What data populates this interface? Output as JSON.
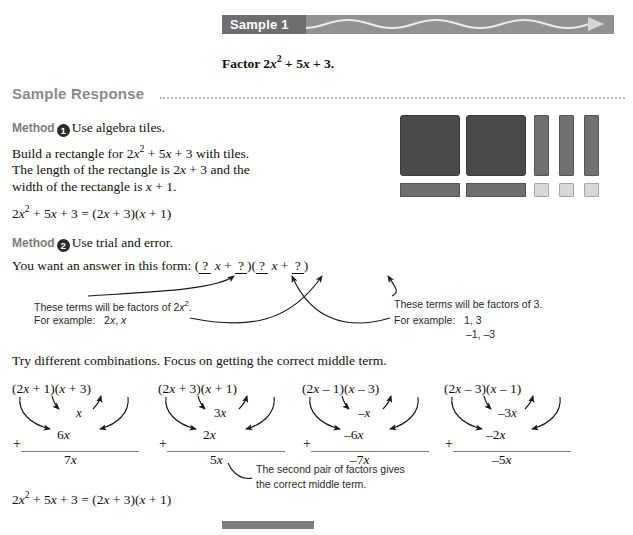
{
  "banner": {
    "label": "Sample 1",
    "bar_color": "#929292",
    "label_color": "#6e6e6e",
    "wave_color": "#e8e8e8"
  },
  "prompt": {
    "prefix": "Factor 2",
    "var": "x",
    "exp": "2",
    "rest": " + 5x + 3."
  },
  "sample_response": {
    "heading": "Sample Response"
  },
  "method1": {
    "label": "Method",
    "number": "1",
    "title": "Use algebra tiles.",
    "line1": "Build a rectangle for 2x2 + 5x + 3 with tiles.",
    "line2a": "The length of the rectangle is 2x + 3 and the",
    "line2b": "width of the rectangle is x + 1.",
    "equation": "2x2 + 5x + 3 = (2x + 3)(x + 1)"
  },
  "tiles": {
    "x2_count": 2,
    "x_vertical_count": 3,
    "x_horizontal_count": 2,
    "unit_count": 3,
    "x2_color": "#4a4a4a",
    "x_color": "#6e6e6e",
    "unit_color": "#d8d8d8"
  },
  "method2": {
    "label": "Method",
    "number": "2",
    "title": "Use trial and error.",
    "form_lead": "You want an answer in this form:",
    "form_open1": "(",
    "q1": "?",
    "form_mid1": "x +",
    "q2": "?",
    "form_close1": ")(",
    "q3": "?",
    "form_mid2": "x +",
    "q4": "?",
    "form_close2": ")"
  },
  "annotations": {
    "left_line1": "These terms will be factors of 2x2.",
    "left_line2_label": "For example:",
    "left_line2_value": "2x, x",
    "right_line1": "These terms will be factors of 3.",
    "right_line2_label": "For example:",
    "right_line2_value": "1, 3",
    "right_line3_value": "–1, –3",
    "callout_line1": "The second pair of factors gives",
    "callout_line2": "the correct middle term."
  },
  "try_line": "Try different combinations. Focus on getting the correct middle term.",
  "combinations": [
    {
      "expression": "(2x + 1)(x + 3)",
      "inner": "x",
      "outer": "6x",
      "plus": "+",
      "total": "7x"
    },
    {
      "expression": "(2x + 3)(x + 1)",
      "inner": "3x",
      "outer": "2x",
      "plus": "+",
      "total": "5x"
    },
    {
      "expression": "(2x – 1)(x – 3)",
      "inner": "–x",
      "outer": "–6x",
      "plus": "+",
      "total": "–7x"
    },
    {
      "expression": "(2x – 3)(x – 1)",
      "inner": "–3x",
      "outer": "–2x",
      "plus": "+",
      "total": "–5x"
    }
  ],
  "final_equation": "2x2 + 5x + 3 = (2x + 3)(x + 1)"
}
